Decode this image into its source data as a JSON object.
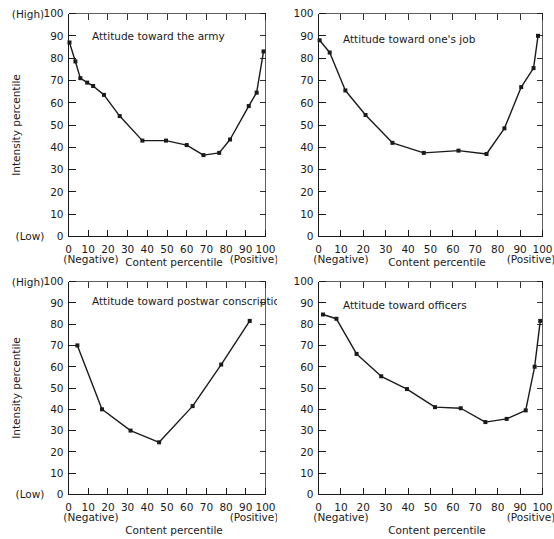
{
  "figure": {
    "panel_count": 4,
    "background_color": "#ffffff",
    "line_color": "#1a1a1a"
  },
  "axis_common": {
    "ylabel": "Intensity percentile",
    "xlabel": "Content percentile",
    "y_high_label": "(High)",
    "y_low_label": "(Low)",
    "x_negative_label": "(Negative)",
    "x_positive_label": "(Positive)",
    "yticks": [
      0,
      10,
      20,
      30,
      40,
      50,
      60,
      70,
      80,
      90,
      100
    ],
    "xticks": [
      0,
      10,
      20,
      30,
      40,
      50,
      60,
      70,
      80,
      90,
      100
    ],
    "xlim": [
      0,
      100
    ],
    "ylim": [
      0,
      100
    ]
  },
  "chart_data": [
    {
      "type": "line",
      "panel": "top-left",
      "title": "Attitude toward the army",
      "xlabel": "Content percentile",
      "ylabel": "Intensity percentile",
      "xlim": [
        0,
        100
      ],
      "ylim": [
        0,
        100
      ],
      "grid": false,
      "legend": "none",
      "x": [
        0.5,
        3.5,
        6.0,
        9.5,
        12.5,
        18.0,
        26.0,
        37.5,
        49.5,
        60.0,
        68.5,
        76.5,
        82.0,
        91.5,
        95.5,
        99.0
      ],
      "y": [
        87.0,
        78.5,
        71.0,
        69.0,
        67.5,
        63.5,
        54.0,
        43.0,
        43.0,
        41.0,
        36.5,
        37.5,
        43.5,
        58.5,
        64.5,
        83.0
      ]
    },
    {
      "type": "line",
      "panel": "top-right",
      "title": "Attitude toward one's job",
      "xlabel": "Content percentile",
      "ylabel": "Intensity percentile",
      "xlim": [
        0,
        100
      ],
      "ylim": [
        0,
        100
      ],
      "grid": false,
      "legend": "none",
      "x": [
        0.5,
        5.0,
        12.0,
        21.0,
        33.0,
        47.0,
        62.5,
        75.0,
        83.0,
        90.5,
        96.0,
        98.0
      ],
      "y": [
        88.0,
        82.5,
        65.5,
        54.5,
        42.0,
        37.5,
        38.5,
        37.0,
        48.5,
        67.0,
        75.5,
        90.0
      ]
    },
    {
      "type": "line",
      "panel": "bottom-left",
      "title": "Attitude toward postwar conscription",
      "xlabel": "Content percentile",
      "ylabel": "Intensity percentile",
      "xlim": [
        0,
        100
      ],
      "ylim": [
        0,
        100
      ],
      "grid": false,
      "legend": "none",
      "x": [
        4.5,
        17.0,
        31.5,
        46.0,
        63.0,
        77.5,
        92.0
      ],
      "y": [
        70.0,
        40.0,
        30.0,
        24.5,
        41.5,
        61.0,
        81.5
      ]
    },
    {
      "type": "line",
      "panel": "bottom-right",
      "title": "Attitude toward officers",
      "xlabel": "Content percentile",
      "ylabel": "Intensity percentile",
      "xlim": [
        0,
        100
      ],
      "ylim": [
        0,
        100
      ],
      "grid": false,
      "legend": "none",
      "x": [
        2.0,
        8.0,
        17.0,
        28.0,
        39.5,
        52.0,
        63.5,
        74.5,
        84.0,
        92.5,
        96.5,
        99.0
      ],
      "y": [
        84.5,
        82.5,
        66.0,
        55.5,
        49.5,
        41.0,
        40.5,
        34.0,
        35.5,
        39.5,
        60.0,
        81.5
      ]
    }
  ]
}
